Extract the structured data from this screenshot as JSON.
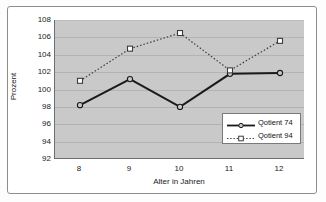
{
  "chart_data": {
    "type": "line",
    "title": "",
    "xlabel": "Alter in Jahren",
    "ylabel": "Prozent",
    "categories": [
      "8",
      "9",
      "10",
      "11",
      "12"
    ],
    "x": [
      8,
      9,
      10,
      11,
      12
    ],
    "ylim": [
      92,
      108
    ],
    "yticks": [
      "92",
      "94",
      "96",
      "98",
      "100",
      "102",
      "104",
      "106",
      "108"
    ],
    "ytick_values": [
      92,
      94,
      96,
      98,
      100,
      102,
      104,
      106,
      108
    ],
    "grid": "horizontal",
    "legend_position": "lower-right",
    "plot_background": "#c9c9c9",
    "figure_background": "#ffffff",
    "series": [
      {
        "name": "Qotient 74",
        "values": [
          98.2,
          101.2,
          98.0,
          101.8,
          101.9
        ],
        "line_style": "solid",
        "marker": "circle",
        "color": "#1a1a1a"
      },
      {
        "name": "Qotient 94",
        "values": [
          101.0,
          104.7,
          106.5,
          102.2,
          105.6
        ],
        "line_style": "dotted",
        "marker": "square",
        "color": "#3c3c3c"
      }
    ]
  },
  "legend": {
    "items": [
      {
        "label": "Qotient 74"
      },
      {
        "label": "Qotient 94"
      }
    ]
  }
}
